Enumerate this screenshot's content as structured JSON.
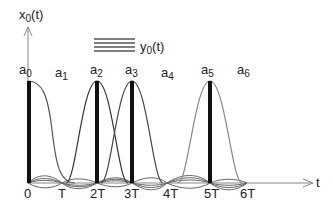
{
  "diagram": {
    "y_axis_label": {
      "main": "x",
      "sub": "0",
      "suffix": "(t)"
    },
    "x_axis_label": "t",
    "legend": {
      "main": "y",
      "sub": "0",
      "suffix": "(t)"
    },
    "coefficients": [
      {
        "main": "a",
        "sub": "0"
      },
      {
        "main": "a",
        "sub": "1"
      },
      {
        "main": "a",
        "sub": "2"
      },
      {
        "main": "a",
        "sub": "3"
      },
      {
        "main": "a",
        "sub": "4"
      },
      {
        "main": "a",
        "sub": "5"
      },
      {
        "main": "a",
        "sub": "6"
      }
    ],
    "ticks": [
      "0",
      "T",
      "2T",
      "3T",
      "4T",
      "5T",
      "6T"
    ],
    "impulses_at": [
      "0",
      "2T",
      "3T",
      "5T"
    ],
    "colors": {
      "axis": "#888888",
      "impulse": "#111111",
      "pulse": "#555555",
      "legend_lines": "#555555"
    }
  }
}
